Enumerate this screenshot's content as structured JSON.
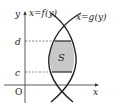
{
  "diagram": {
    "axes": {
      "x_label": "x",
      "y_label": "y",
      "origin_label": "O"
    },
    "curves": [
      {
        "name": "f",
        "label": "x=f(y)"
      },
      {
        "name": "g",
        "label": "x=g(y)"
      }
    ],
    "levels": {
      "upper": "d",
      "lower": "c"
    },
    "region_label": "S",
    "colors": {
      "stroke": "#222222",
      "shade": "#c8c8c8",
      "dash": "#555555"
    }
  }
}
